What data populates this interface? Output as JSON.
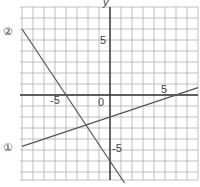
{
  "chart_data": {
    "type": "line",
    "title": "",
    "xlabel": "",
    "ylabel": "y",
    "xlim": [
      -8,
      8
    ],
    "ylim": [
      -8,
      8
    ],
    "grid": true,
    "origin_label": "0",
    "tick_labels": {
      "x": [
        "-5",
        "5"
      ],
      "y": [
        "5",
        "-5"
      ]
    },
    "series": [
      {
        "name": "①",
        "equation": "y = x/3 - 2",
        "points": [
          [
            -8,
            -4.67
          ],
          [
            8,
            0.67
          ]
        ]
      },
      {
        "name": "②",
        "equation": "y = -3x/2 - 6",
        "points": [
          [
            -8,
            6
          ],
          [
            1.33,
            -8
          ]
        ]
      }
    ]
  },
  "labels": {
    "y_axis": "y",
    "origin": "0",
    "x_neg5": "-5",
    "x_pos5": "5",
    "y_pos5": "5",
    "y_neg5": "-5",
    "line1": "①",
    "line2": "②"
  },
  "colors": {
    "grid": "#b0b0b0",
    "axis": "#333333",
    "line": "#555555",
    "text": "#444444"
  }
}
